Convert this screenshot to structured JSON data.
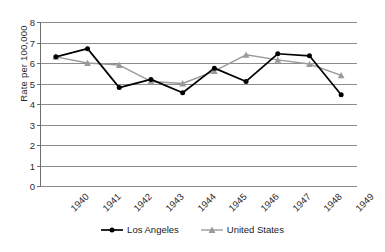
{
  "chart_data": {
    "type": "line",
    "title": "",
    "xlabel": "",
    "ylabel": "Rate per 100,000",
    "categories": [
      "1940",
      "1941",
      "1942",
      "1943",
      "1944",
      "1945",
      "1946",
      "1947",
      "1948",
      "1949"
    ],
    "ylim": [
      0,
      8
    ],
    "y_ticks": [
      0,
      1,
      2,
      3,
      4,
      5,
      6,
      7,
      8
    ],
    "grid": true,
    "legend_position": "bottom-center",
    "series": [
      {
        "name": "Los Angeles",
        "color": "#000000",
        "marker": "circle",
        "values": [
          6.3,
          6.7,
          4.8,
          5.2,
          4.55,
          5.75,
          5.1,
          6.45,
          6.35,
          4.45
        ]
      },
      {
        "name": "United States",
        "color": "#9a9a9a",
        "marker": "triangle",
        "values": [
          6.3,
          6.0,
          5.9,
          5.1,
          5.0,
          5.6,
          6.4,
          6.15,
          5.95,
          5.4
        ]
      }
    ]
  },
  "colors": {
    "gridline": "#8c8c8c",
    "axis": "#6e6e6e",
    "background": "#ffffff",
    "text": "#2b2b2b"
  }
}
